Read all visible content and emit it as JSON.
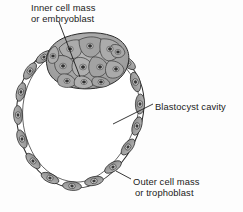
{
  "figure": {
    "background_color": "#fdfdfd",
    "labels": {
      "inner_cell_mass": {
        "line1": "Inner cell mass",
        "line2": "or embryoblast"
      },
      "blastocyst_cavity": {
        "line1": "Blastocyst cavity"
      },
      "outer_cell_mass": {
        "line1": "Outer cell mass",
        "line2": "or trophoblast"
      }
    },
    "colors": {
      "cell_fill": "#9c9c9c",
      "cell_fill_light": "#b5b5b5",
      "cell_outline": "#2e2e2e",
      "nucleus": "#3a3a3a",
      "cavity_fill": "#ffffff",
      "leader_line": "#1a1a1a",
      "text": "#1b1b1b"
    },
    "structures": {
      "inner_cell_mass_cells": 26,
      "trophoblast_cells": 16,
      "cavity_label": "Blastocyst cavity"
    }
  }
}
